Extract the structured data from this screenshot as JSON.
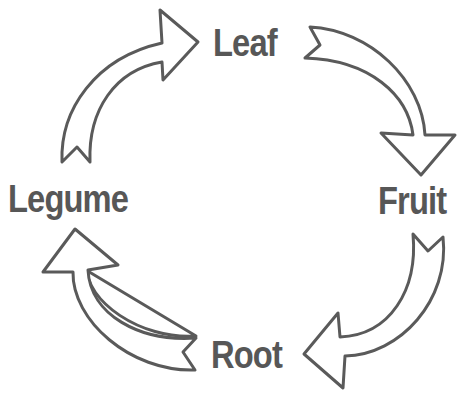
{
  "diagram": {
    "type": "cycle",
    "nodes": [
      {
        "id": "leaf",
        "label": "Leaf"
      },
      {
        "id": "fruit",
        "label": "Fruit"
      },
      {
        "id": "root",
        "label": "Root"
      },
      {
        "id": "legume",
        "label": "Legume"
      }
    ],
    "edges": [
      {
        "from": "legume",
        "to": "leaf"
      },
      {
        "from": "leaf",
        "to": "fruit"
      },
      {
        "from": "fruit",
        "to": "root"
      },
      {
        "from": "root",
        "to": "legume"
      }
    ],
    "colors": {
      "text": "#575757",
      "arrow_outline": "#5a5a5a",
      "arrow_fill": "#ffffff",
      "background": "#ffffff"
    }
  }
}
